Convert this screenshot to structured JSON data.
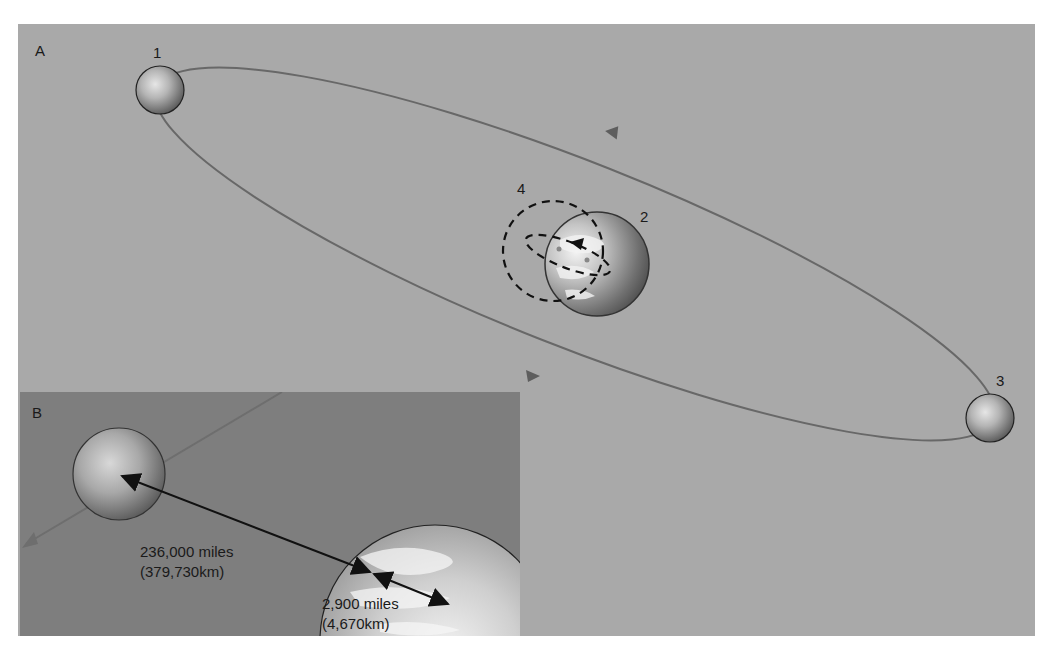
{
  "panel_a": {
    "label": "A",
    "positions": [
      {
        "id": "1",
        "label": "1"
      },
      {
        "id": "2",
        "label": "2"
      },
      {
        "id": "3",
        "label": "3"
      },
      {
        "id": "4",
        "label": "4"
      }
    ]
  },
  "panel_b": {
    "label": "B",
    "moon_distance": {
      "miles": "236,000 miles",
      "km": "(379,730km)"
    },
    "barycenter_distance": {
      "miles": "2,900 miles",
      "km": "(4,670km)"
    }
  },
  "colors": {
    "background_a": "#a9a9a9",
    "background_b": "#7e7e7e",
    "orbit": "#6a6a6a",
    "arrow": "#111111"
  }
}
